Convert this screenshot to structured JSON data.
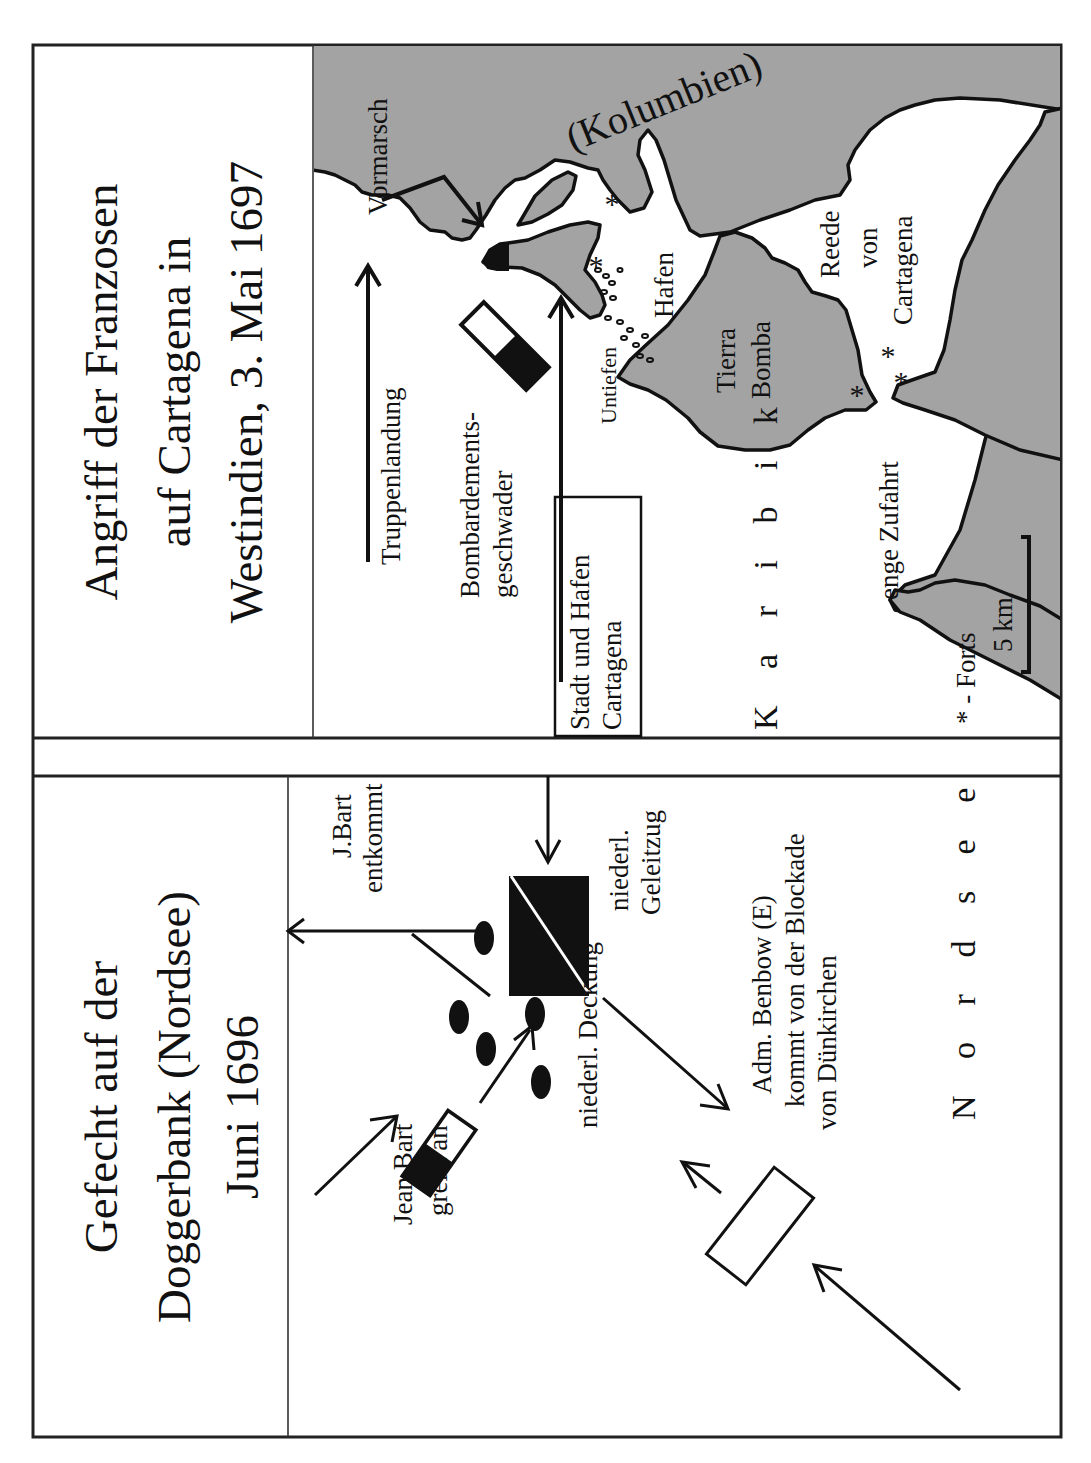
{
  "panels": {
    "cartagena": {
      "title_lines": [
        "Angriff der Franzosen",
        "auf Cartagena in",
        "Westindien,  3. Mai 1697"
      ],
      "labels": {
        "region": "(Kolumbien)",
        "advance": "Vormarsch",
        "troop_landing": "Truppenlandung",
        "bombardment_squadron_1": "Bombardements-",
        "bombardment_squadron_2": "geschwader",
        "city_box_1": "Stadt und Hafen",
        "city_box_2": "Cartagena",
        "shoals": "Untiefen",
        "harbour": "Hafen",
        "island_1": "Tierra",
        "island_2": "Bomba",
        "roadstead_1": "Reede",
        "roadstead_2": "von",
        "roadstead_3": "Cartagena",
        "narrow_entrance": "enge Zufahrt",
        "sea": "Karibik",
        "legend_forts": "* - Forts",
        "scale": "5 km"
      },
      "fort_symbol": "*",
      "colors": {
        "land": "#a3a3a3",
        "water": "#ffffff",
        "ink": "#111111"
      }
    },
    "doggerbank": {
      "title_lines": [
        "Gefecht auf der",
        "Doggerbank (Nordsee)",
        "Juni  1696"
      ],
      "labels": {
        "jean_bart_1": "Jean Bart",
        "jean_bart_2": "greift an",
        "bart_escapes_1": "J.Bart",
        "bart_escapes_2": "entkommt",
        "dutch_escort_1": "niederl.",
        "dutch_escort_2": "Geleitzug",
        "dutch_cover": "niederl. Deckung",
        "benbow_1": "Adm. Benbow (E)",
        "benbow_2": "kommt von der Blockade",
        "benbow_3": "von Dünkirchen",
        "sea": "Nordsee"
      }
    }
  }
}
